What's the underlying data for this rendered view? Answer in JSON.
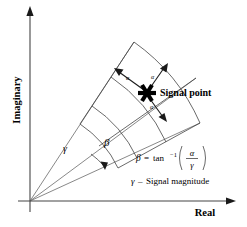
{
  "figure": {
    "background_color": "#ffffff",
    "line_color": "#444444",
    "text_color": "#000000"
  },
  "axes": {
    "vertical": {
      "label": "Imaginary",
      "orientation": "vertical",
      "arrow": "up"
    },
    "horizontal": {
      "label": "Real",
      "orientation": "horizontal",
      "arrow": "right"
    },
    "origin_label": ""
  },
  "annotations": {
    "signal_point_label": "Signal point",
    "gamma_symbol": "γ",
    "beta_symbol": "β",
    "alpha_symbol": "α",
    "alpha_labels": [
      "α",
      "α",
      "α"
    ],
    "marker_type": "six-pointed-star"
  },
  "formula": {
    "lhs": "β",
    "equals": "=",
    "function": "tan",
    "exponent": "−1",
    "numerator": "α",
    "denominator": "γ",
    "full_text": "β = tan⁻¹(α/γ)"
  },
  "caption": {
    "symbol": "γ",
    "dash": "–",
    "text": "Signal magnitude",
    "full_text": "γ – Signal magnitude"
  },
  "geometry": {
    "origin": [
      30,
      201
    ],
    "sector_inner_radius_cells": 2,
    "sector_rays": 3,
    "arcs": 4,
    "signal_point": [
      147,
      93
    ]
  }
}
